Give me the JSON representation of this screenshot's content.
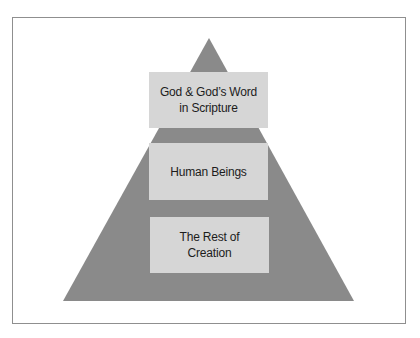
{
  "diagram": {
    "type": "pyramid",
    "colors": {
      "background": "#ffffff",
      "frame_border": "#8f8f8f",
      "pyramid_fill": "#8a8a8a",
      "box_fill": "#d6d6d6",
      "text": "#1c1c1c"
    },
    "levels": [
      {
        "rank": 1,
        "line1": "God & God’s Word",
        "line2": "in Scripture"
      },
      {
        "rank": 2,
        "line1": "Human Beings",
        "line2": ""
      },
      {
        "rank": 3,
        "line1": "The Rest of",
        "line2": "Creation"
      }
    ]
  }
}
